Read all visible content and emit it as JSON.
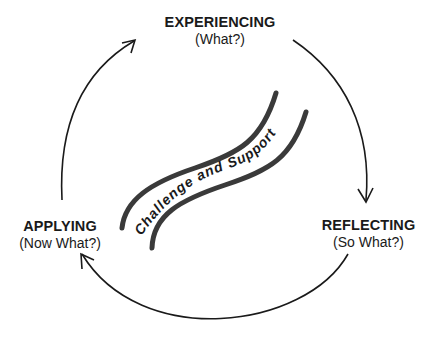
{
  "diagram": {
    "type": "cycle",
    "stages": [
      {
        "id": "experiencing",
        "title": "EXPERIENCING",
        "subtitle": "(What?)"
      },
      {
        "id": "reflecting",
        "title": "REFLECTING",
        "subtitle": "(So What?)"
      },
      {
        "id": "applying",
        "title": "APPLYING",
        "subtitle": "(Now What?)"
      }
    ],
    "center_label": "Challenge and Support",
    "flow": [
      "experiencing",
      "reflecting",
      "applying",
      "experiencing"
    ],
    "colors": {
      "stroke": "#1a1a1a",
      "band": "#3a3a3a",
      "background": "#ffffff"
    }
  }
}
